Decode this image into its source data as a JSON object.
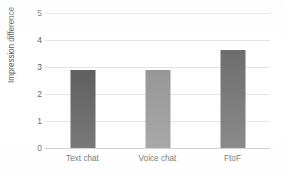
{
  "chart_data": {
    "type": "bar",
    "title": "",
    "subtitle": "",
    "xlabel": "",
    "ylabel": "Impression difference",
    "categories": [
      "Text chat",
      "Voice chat",
      "FtoF"
    ],
    "values": [
      2.9,
      2.9,
      3.62
    ],
    "ylim": [
      0,
      5
    ],
    "ytick_labels": [
      "0",
      "1",
      "2",
      "3",
      "4",
      "5"
    ],
    "ytick_values": [
      0,
      1,
      2,
      3,
      4,
      5
    ],
    "grid": true,
    "legend": false,
    "legend_position": "none",
    "bar_colors": [
      "#595959",
      "#939393",
      "#6e6e6e"
    ],
    "series": [
      {
        "name": "Impression difference",
        "values": [
          2.9,
          2.9,
          3.62
        ]
      }
    ]
  },
  "colors": {
    "background": "#ffffff",
    "gridline": "#e3e3e3",
    "axis_line": "#c9c9c9",
    "text": "#555555"
  }
}
